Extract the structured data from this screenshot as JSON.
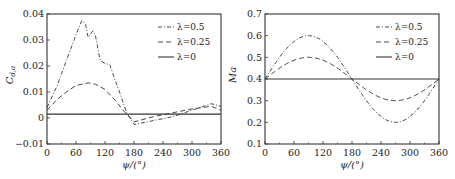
{
  "chart_data": [
    {
      "type": "line",
      "title": "",
      "xlabel": "ψ/(°)",
      "ylabel": "C_{d,a}",
      "xlim": [
        0,
        360
      ],
      "ylim": [
        -0.01,
        0.04
      ],
      "xticks": [
        0,
        60,
        120,
        180,
        240,
        300,
        360
      ],
      "yticks": [
        -0.01,
        0,
        0.01,
        0.02,
        0.03,
        0.04
      ],
      "ytick_labels": [
        "−0.01",
        "0",
        "0.01",
        "0.02",
        "0.03",
        "0.04"
      ],
      "grid": false,
      "legend_position": "upper right",
      "series": [
        {
          "name": "λ=0.5",
          "style": "dash-dot",
          "x": [
            0,
            20,
            40,
            60,
            72,
            80,
            85,
            95,
            100,
            110,
            120,
            130,
            140,
            150,
            165,
            180,
            220,
            260,
            300,
            340,
            360
          ],
          "values": [
            0.004,
            0.012,
            0.022,
            0.032,
            0.0375,
            0.036,
            0.031,
            0.0335,
            0.032,
            0.022,
            0.021,
            0.0205,
            0.015,
            0.01,
            0.002,
            -0.0025,
            -0.001,
            0.0005,
            0.003,
            0.0055,
            0.0045
          ]
        },
        {
          "name": "λ=0.25",
          "style": "dashed",
          "x": [
            0,
            20,
            40,
            60,
            85,
            100,
            120,
            140,
            160,
            170,
            180,
            220,
            260,
            300,
            340,
            360
          ],
          "values": [
            0.003,
            0.007,
            0.01,
            0.0125,
            0.0135,
            0.013,
            0.011,
            0.007,
            0.0025,
            0.0005,
            -0.0015,
            0.0005,
            0.002,
            0.0035,
            0.0045,
            0.003
          ]
        },
        {
          "name": "λ=0",
          "style": "solid",
          "x": [
            0,
            360
          ],
          "values": [
            0.0015,
            0.0015
          ]
        }
      ]
    },
    {
      "type": "line",
      "title": "",
      "xlabel": "ψ/(°)",
      "ylabel": "Ma",
      "xlim": [
        0,
        360
      ],
      "ylim": [
        0.1,
        0.7
      ],
      "xticks": [
        0,
        60,
        120,
        180,
        240,
        300,
        360
      ],
      "yticks": [
        0.1,
        0.2,
        0.3,
        0.4,
        0.5,
        0.6,
        0.7
      ],
      "ytick_labels": [
        "0.1",
        "0.2",
        "0.3",
        "0.4",
        "0.5",
        "0.6",
        "0.7"
      ],
      "grid": false,
      "legend_position": "upper right",
      "series": [
        {
          "name": "λ=0.5",
          "style": "dash-dot",
          "x": [
            0,
            30,
            60,
            90,
            120,
            150,
            180,
            210,
            240,
            270,
            300,
            330,
            360
          ],
          "values": [
            0.4,
            0.5,
            0.573,
            0.6,
            0.573,
            0.5,
            0.4,
            0.3,
            0.227,
            0.2,
            0.227,
            0.3,
            0.4
          ]
        },
        {
          "name": "λ=0.25",
          "style": "dashed",
          "x": [
            0,
            30,
            60,
            90,
            120,
            150,
            180,
            210,
            240,
            270,
            300,
            330,
            360
          ],
          "values": [
            0.4,
            0.45,
            0.487,
            0.5,
            0.487,
            0.45,
            0.4,
            0.35,
            0.313,
            0.3,
            0.313,
            0.35,
            0.4
          ]
        },
        {
          "name": "λ=0",
          "style": "solid",
          "x": [
            0,
            360
          ],
          "values": [
            0.4,
            0.4
          ]
        }
      ]
    }
  ]
}
